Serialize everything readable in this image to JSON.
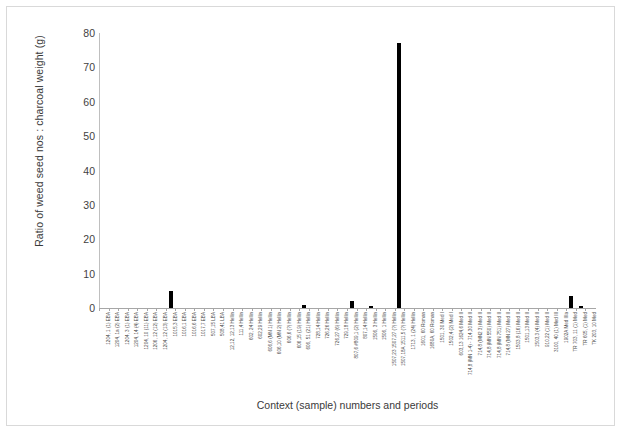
{
  "chart_data": {
    "type": "bar",
    "title": "",
    "xlabel": "Context (sample) numbers and periods",
    "ylabel": "Ratio of weed seed nos : charcoal weight (g)",
    "ylim": [
      0,
      80
    ],
    "yticks": [
      0,
      10,
      20,
      30,
      40,
      50,
      60,
      70,
      80
    ],
    "grid": false,
    "legend": false,
    "bar_color": "#000000",
    "categories": [
      "1204, 1 (1) EBA",
      "1204, 1a (2) EBA",
      "1204, 3 (1) EBA",
      "1204, 14 (4) EBA",
      "1204, 10 (11) EBA",
      "1206, 12 (12) EBA",
      "1204, 12 (13) EBA",
      "1015,3  EBA",
      "1016,1 EBA",
      "1016,6 EBA",
      "1017,7 EBA",
      "507,15 LBA",
      "508,41 LBA",
      "12,12, 12,13 Hellin",
      "111,4 Hellin",
      "602, 24 Hellin",
      "602,29 Hellin",
      "606,6 (MN 1) Hellin",
      "606,10 (MN 2) Hellin",
      "606,6 (?) Hellin",
      "606,15 (19) Hellin",
      "606, 51 (21) Hellin",
      "728,14 Hellin",
      "726,26 Hellin",
      "726,27 (6) Hellin",
      "729,18 Hellin",
      "807,6 #809,1 (2) Hellin",
      "807,14 Hellin",
      "1506, 3 Hellin",
      "1506, 1 Hellin",
      "1507,23 1507,27 (?) Hellin",
      "1507,18A 1511,5 (?) Hellin",
      "1713, 1 (24) Hellin",
      "1601, 60 Roman",
      "1680A, 60 Roman",
      "1501, 30 Med I",
      "1502,4 (2) Med I",
      "603,13 1624,6 Med II",
      "714,8 (MN 1-4) - 714,30 Med II",
      "714,8 (MN2 3) Med II",
      "714,8 (MN 550) Med II",
      "714,8 (MN 751) Med II",
      "714,8 (MN 27) Med II",
      "1503,8 (16) Med II",
      "1501,13 Med II",
      "1503,3 (4) Med II",
      "910,22 (1) Med II",
      "3100, 40 (1) Med III",
      "1902A Med IIIa",
      "TR 703, 11 (1) Med",
      "TR 605, (1) Med",
      "TK 203, 10 Med"
    ],
    "values": [
      0,
      0,
      0,
      0,
      0,
      0,
      0,
      5.0,
      0,
      0,
      0,
      0,
      0,
      0,
      0,
      0,
      0,
      0,
      0,
      0,
      0,
      0,
      0,
      0,
      0,
      0,
      0,
      0,
      0,
      0,
      0,
      0,
      0,
      0,
      0,
      0,
      0,
      0,
      0,
      0,
      0,
      0,
      0,
      0,
      0,
      0,
      0,
      0,
      0,
      0,
      0,
      0
    ],
    "nonzero_points": [
      {
        "index": 7,
        "label": "1015,3  EBA",
        "value": 5.0
      },
      {
        "index": 21,
        "label": "606, 51 (21) Hellin",
        "value": 0.9
      },
      {
        "index": 26,
        "label": "807,6 #809,1 (2) Hellin",
        "value": 1.9
      },
      {
        "index": 28,
        "label": "1506, 3 Hellin",
        "value": 0.5
      },
      {
        "index": 31,
        "label": "1507,18A 1511,5 (?) Hellin",
        "value": 77.0
      },
      {
        "index": 49,
        "label": "TR 703, 11 (1) Med",
        "value": 3.4
      },
      {
        "index": 50,
        "label": "TR 605, (1) Med",
        "value": 0.6
      }
    ],
    "max_value": 77.0
  }
}
